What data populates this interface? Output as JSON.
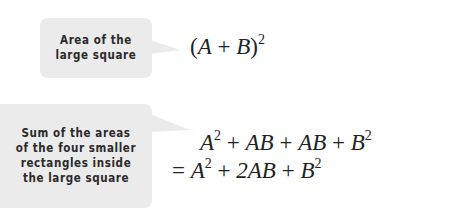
{
  "callouts": [
    {
      "lines": [
        "Area of the",
        "large square"
      ]
    },
    {
      "lines": [
        "Sum of the areas",
        "of the four smaller",
        "rectangles inside",
        "the large square"
      ]
    }
  ],
  "equations": {
    "line1": {
      "open": "(",
      "a": "A",
      "plus": "+",
      "b": "B",
      "close": ")",
      "exp": "2"
    },
    "line2": {
      "t1": "A",
      "e1": "2",
      "p1": "+",
      "t2": "AB",
      "p2": "+",
      "t3": "AB",
      "p3": "+",
      "t4": "B",
      "e4": "2"
    },
    "line3": {
      "eq": "=",
      "t1": "A",
      "e1": "2",
      "p1": "+",
      "t2": "2AB",
      "p2": "+",
      "t3": "B",
      "e3": "2"
    }
  },
  "colors": {
    "callout_bg": "#ebebeb",
    "text": "#222222"
  }
}
